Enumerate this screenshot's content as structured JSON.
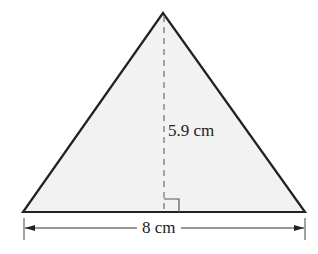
{
  "diagram": {
    "shape": "triangle",
    "fill_color": "#f2f2f2",
    "stroke_color": "#222222",
    "height_label": "5.9 cm",
    "base_label": "8 cm",
    "features": [
      "dashed altitude from apex to base",
      "right-angle marker at foot of altitude",
      "base dimension line with arrows"
    ]
  }
}
